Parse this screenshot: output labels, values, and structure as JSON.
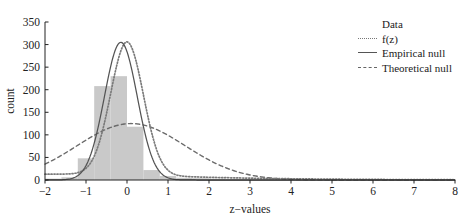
{
  "chart_data": {
    "type": "bar",
    "title": "",
    "subtitle": "",
    "xlabel": "z−values",
    "ylabel": "count",
    "xlim": [
      -2,
      8
    ],
    "ylim": [
      0,
      350
    ],
    "xticks": [
      -2,
      -1,
      0,
      1,
      2,
      3,
      4,
      5,
      6,
      7,
      8
    ],
    "xtick_labels": [
      "−2",
      "−1",
      "0",
      "1",
      "2",
      "3",
      "4",
      "5",
      "6",
      "7",
      "8"
    ],
    "yticks": [
      0,
      50,
      100,
      150,
      200,
      250,
      300,
      350
    ],
    "ytick_labels": [
      "0",
      "50",
      "100",
      "150",
      "200",
      "250",
      "300",
      "350"
    ],
    "grid": false,
    "legend_position": "top-right",
    "bar_width": 0.4,
    "histogram": {
      "name": "Data",
      "color": "#c9c9c9",
      "bin_centers": [
        -1.8,
        -1.4,
        -1.0,
        -0.6,
        -0.2,
        0.2,
        0.6,
        1.0,
        1.4,
        1.8,
        2.2,
        2.6,
        3.0,
        3.4,
        3.8,
        4.2,
        4.6,
        5.0,
        5.4,
        5.8,
        6.2,
        6.6,
        7.0,
        7.4,
        7.8
      ],
      "values": [
        3,
        6,
        48,
        208,
        230,
        118,
        22,
        9,
        5,
        4,
        3,
        2,
        2,
        2,
        1,
        1,
        1,
        1,
        1,
        1,
        1,
        1,
        1,
        1,
        1
      ]
    },
    "series": [
      {
        "name": "f(z)",
        "style": "dotted",
        "color": "#7a7a7a",
        "peak_value": 293,
        "peak_x": 0.0,
        "description": "mixture density fit, dotted curve"
      },
      {
        "name": "Empirical null",
        "style": "solid",
        "color": "#545454",
        "peak_value": 305,
        "peak_x": -0.15,
        "description": "narrow solid normal curve fitted to central bulk"
      },
      {
        "name": "Theoretical null",
        "style": "dashed",
        "color": "#6b6b6b",
        "peak_value": 125,
        "peak_x": 0.1,
        "description": "broad dashed standard normal curve"
      }
    ]
  },
  "legend": {
    "entries": [
      {
        "label": "Data",
        "key": "swatch-filled"
      },
      {
        "label": "f(z)",
        "key": "line-dotted"
      },
      {
        "label": "Empirical null",
        "key": "line-solid"
      },
      {
        "label": "Theoretical null",
        "key": "line-dashed"
      }
    ]
  }
}
